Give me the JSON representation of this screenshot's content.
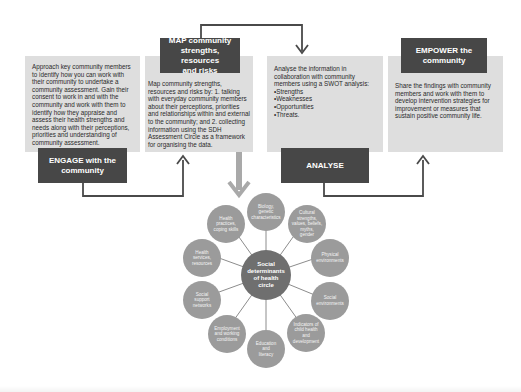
{
  "colors": {
    "box_fill": "#dedede",
    "label_fill": "#474747",
    "connector": "#4a4a4a",
    "down_arrow": "#a9a9a9",
    "node_fill": "#9b9b9b",
    "hub_fill": "#6f6f6f"
  },
  "steps": [
    {
      "id": "engage",
      "label": "ENGAGE with the\ncommunity",
      "text": "Approach key community members to identify how you can work with their community to undertake a community assessment. Gain their consent to work in and with the community and work with them to identify how they appraise and assess their health strengths and needs along with their perceptions, priorities and understanding of community assessment."
    },
    {
      "id": "map",
      "label": "MAP community\nstrengths, resources\nand risks",
      "text": "Map community strengths, resources and risks by: 1. talking with everyday community members about their perceptions, priorities and relationships within and external to the community; and 2. collecting information using the SDH Assessment Circle as a framework for organising the data."
    },
    {
      "id": "analyse",
      "label": "ANALYSE",
      "text": "Analyse the information in collaboration with community members using a SWOT analysis:",
      "bullets": [
        "Strengths",
        "Weaknesses",
        "Opportunities",
        "Threats."
      ]
    },
    {
      "id": "empower",
      "label": "EMPOWER the\ncommunity",
      "text": "Share the findings with community members and work with them to develop intervention strategies for improvement or measures that sustain positive community life."
    }
  ],
  "sdh_circle": {
    "hub": "Social\ndeterminants\nof health\ncircle",
    "nodes": [
      "Biology,\ngenetic\ncharacteristics",
      "Cultural\nstrengths,\nvalues, beliefs,\nmyths,\ngender",
      "Physical\nenvironments",
      "Social\nenvironments",
      "Indicators of\nchild health and\ndevelopment",
      "Education\nand\nliteracy",
      "Employment\nand working\nconditions",
      "Social\nsupport\nnetworks",
      "Health\nservices,\nresources",
      "Health\npractices,\ncoping skills"
    ]
  }
}
